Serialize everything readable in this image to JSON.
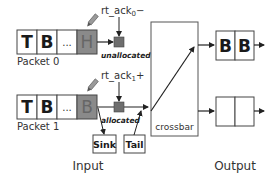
{
  "packets": [
    {
      "label": "Packet 0",
      "cells": [
        "T",
        "B",
        "...",
        "H"
      ],
      "head_cell_shaded": true,
      "ack_label": "rt_ack",
      "ack_sub": "0",
      "ack_sign": "−",
      "state": "unallocated"
    },
    {
      "label": "Packet 1",
      "cells": [
        "T",
        "B",
        "...",
        "B"
      ],
      "head_cell_shaded": true,
      "ack_label": "rt_ack",
      "ack_sub": "1",
      "ack_sign": "+",
      "state": "allocated"
    }
  ],
  "sink_label": "Sink",
  "tail_label": "Tail",
  "crossbar_label": "crossbar",
  "outputs": [
    {
      "cells": [
        "B",
        "B"
      ]
    },
    {
      "cells": [
        "",
        ""
      ]
    }
  ],
  "section_labels": {
    "input": "Input",
    "output": "Output"
  },
  "colors": {
    "shaded_cell": "#8a8a8a",
    "state_square": "#6e6e6e",
    "stroke": "#333333"
  }
}
